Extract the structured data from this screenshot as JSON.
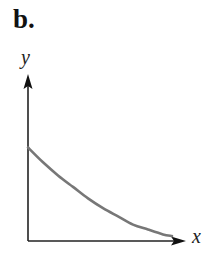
{
  "panel": {
    "label": "b."
  },
  "chart_data": {
    "type": "line",
    "title": "",
    "xlabel": "x",
    "ylabel": "y",
    "grid": false,
    "legend": null,
    "ticks": {
      "x": [],
      "y": []
    },
    "xlim": [
      0,
      1
    ],
    "ylim": [
      0,
      1
    ],
    "series": [
      {
        "name": "decreasing convex curve",
        "x": [
          0,
          0.1,
          0.2,
          0.3,
          0.4,
          0.5,
          0.6,
          0.7,
          0.8,
          0.9,
          0.96
        ],
        "y": [
          0.57,
          0.48,
          0.4,
          0.33,
          0.26,
          0.2,
          0.15,
          0.1,
          0.07,
          0.04,
          0.03
        ]
      }
    ],
    "colors": {
      "axis": "#222222",
      "curve": "#777777"
    }
  }
}
